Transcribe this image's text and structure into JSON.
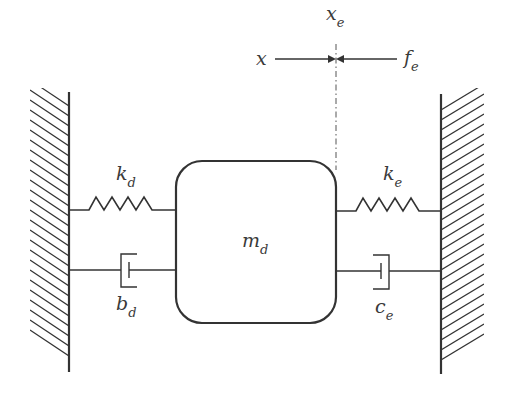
{
  "diagram": {
    "type": "mass-spring-damper schematic",
    "colors": {
      "line": "#333333",
      "text": "#3a3a3a",
      "background": "#ffffff"
    },
    "labels": {
      "x": {
        "base": "x",
        "sub": ""
      },
      "xe": {
        "base": "x",
        "sub": "e"
      },
      "fe": {
        "base": "f",
        "sub": "e"
      },
      "kd": {
        "base": "k",
        "sub": "d"
      },
      "ke": {
        "base": "k",
        "sub": "e"
      },
      "md": {
        "base": "m",
        "sub": "d"
      },
      "bd": {
        "base": "b",
        "sub": "d"
      },
      "ce": {
        "base": "c",
        "sub": "e"
      }
    },
    "components": [
      {
        "id": "left-wall",
        "kind": "fixed wall"
      },
      {
        "id": "spring-kd",
        "kind": "spring",
        "label": "kd"
      },
      {
        "id": "damper-bd",
        "kind": "damper",
        "label": "bd"
      },
      {
        "id": "mass-md",
        "kind": "mass",
        "label": "md"
      },
      {
        "id": "spring-ke",
        "kind": "spring",
        "label": "ke"
      },
      {
        "id": "damper-ce",
        "kind": "damper",
        "label": "ce"
      },
      {
        "id": "right-wall",
        "kind": "fixed wall"
      },
      {
        "id": "reference-xe",
        "kind": "dash-dot reference line",
        "label": "xe"
      },
      {
        "id": "force-arrows",
        "kind": "opposing arrows",
        "labels": [
          "x",
          "fe"
        ]
      }
    ]
  }
}
